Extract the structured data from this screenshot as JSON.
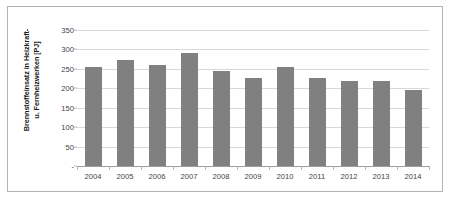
{
  "chart_data": {
    "type": "bar",
    "title": "",
    "xlabel": "",
    "ylabel": "Brennstoffeinsatz in Heizkraft- u. Fernheizwerken [PJ]",
    "ylabel_lines": [
      "Brennstoffeinsatz in Heizkraft-",
      "u. Fernheizwerken [PJ]"
    ],
    "categories": [
      "2004",
      "2005",
      "2006",
      "2007",
      "2008",
      "2009",
      "2010",
      "2011",
      "2012",
      "2013",
      "2014"
    ],
    "values": [
      255,
      272,
      258,
      289,
      243,
      226,
      253,
      226,
      219,
      217,
      196
    ],
    "series": [
      {
        "name": "Brennstoffeinsatz",
        "values": [
          255,
          272,
          258,
          289,
          243,
          226,
          253,
          226,
          219,
          217,
          196
        ],
        "color": "#808080"
      }
    ],
    "ylim": [
      0,
      350
    ],
    "yticks": [
      0,
      50,
      100,
      150,
      200,
      250,
      300,
      350
    ],
    "ytick_labels": [
      "-",
      "50",
      "100",
      "150",
      "200",
      "250",
      "300",
      "350"
    ],
    "grid": true,
    "legend": false,
    "legend_position": "none",
    "unit": "PJ"
  },
  "colors": {
    "bar": "#808080",
    "gridline": "#d9d9d9",
    "axis": "#9c9c9c",
    "frame_border": "#b3b3b3",
    "tick_text": "#3f3f3f",
    "axis_title_text": "#1a1a1a",
    "background": "#ffffff"
  }
}
